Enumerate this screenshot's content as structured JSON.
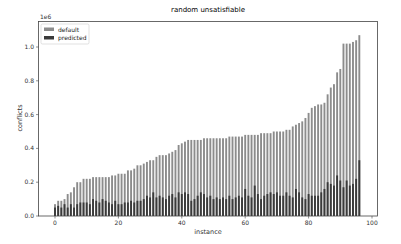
{
  "chart_data": {
    "type": "bar",
    "title": "random unsatisfiable",
    "xlabel": "instance",
    "ylabel": "conflicts",
    "y_scale_label": "1e6",
    "xlim": [
      -5,
      102
    ],
    "ylim": [
      0,
      1.1
    ],
    "xticks": [
      0,
      20,
      40,
      60,
      80,
      100
    ],
    "yticks": [
      0.0,
      0.2,
      0.4,
      0.6,
      0.8,
      1.0
    ],
    "ytick_labels": [
      "0.0",
      "0.2",
      "0.4",
      "0.6",
      "0.8",
      "1.0"
    ],
    "grid": false,
    "legend_position": "upper left",
    "colors": {
      "default": "#8c8c8c",
      "predicted": "#3a3a3a"
    },
    "x": [
      0,
      1,
      2,
      3,
      4,
      5,
      6,
      7,
      8,
      9,
      10,
      11,
      12,
      13,
      14,
      15,
      16,
      17,
      18,
      19,
      20,
      21,
      22,
      23,
      24,
      25,
      26,
      27,
      28,
      29,
      30,
      31,
      32,
      33,
      34,
      35,
      36,
      37,
      38,
      39,
      40,
      41,
      42,
      43,
      44,
      45,
      46,
      47,
      48,
      49,
      50,
      51,
      52,
      53,
      54,
      55,
      56,
      57,
      58,
      59,
      60,
      61,
      62,
      63,
      64,
      65,
      66,
      67,
      68,
      69,
      70,
      71,
      72,
      73,
      74,
      75,
      76,
      77,
      78,
      79,
      80,
      81,
      82,
      83,
      84,
      85,
      86,
      87,
      88,
      89,
      90,
      91,
      92,
      93,
      94,
      95,
      96
    ],
    "series": [
      {
        "name": "default",
        "values": [
          0.07,
          0.09,
          0.09,
          0.1,
          0.13,
          0.14,
          0.17,
          0.2,
          0.2,
          0.22,
          0.22,
          0.22,
          0.23,
          0.23,
          0.23,
          0.23,
          0.23,
          0.23,
          0.24,
          0.24,
          0.25,
          0.25,
          0.25,
          0.27,
          0.27,
          0.28,
          0.3,
          0.3,
          0.31,
          0.32,
          0.33,
          0.33,
          0.35,
          0.36,
          0.36,
          0.36,
          0.37,
          0.38,
          0.39,
          0.42,
          0.43,
          0.44,
          0.45,
          0.45,
          0.45,
          0.45,
          0.45,
          0.46,
          0.46,
          0.46,
          0.46,
          0.46,
          0.46,
          0.46,
          0.46,
          0.47,
          0.47,
          0.47,
          0.47,
          0.47,
          0.48,
          0.48,
          0.48,
          0.48,
          0.48,
          0.49,
          0.49,
          0.49,
          0.49,
          0.5,
          0.5,
          0.5,
          0.5,
          0.51,
          0.51,
          0.53,
          0.54,
          0.55,
          0.56,
          0.58,
          0.61,
          0.64,
          0.65,
          0.66,
          0.66,
          0.67,
          0.72,
          0.76,
          0.78,
          0.85,
          0.87,
          1.02,
          1.02,
          1.02,
          1.03,
          1.04,
          1.07
        ]
      },
      {
        "name": "predicted",
        "values": [
          0.05,
          0.06,
          0.05,
          0.07,
          0.05,
          0.07,
          0.05,
          0.07,
          0.08,
          0.08,
          0.08,
          0.07,
          0.1,
          0.09,
          0.08,
          0.1,
          0.09,
          0.08,
          0.07,
          0.09,
          0.07,
          0.07,
          0.08,
          0.08,
          0.09,
          0.08,
          0.09,
          0.09,
          0.1,
          0.12,
          0.11,
          0.14,
          0.11,
          0.12,
          0.11,
          0.1,
          0.12,
          0.13,
          0.11,
          0.14,
          0.13,
          0.14,
          0.13,
          0.09,
          0.1,
          0.12,
          0.14,
          0.13,
          0.11,
          0.12,
          0.1,
          0.11,
          0.1,
          0.11,
          0.1,
          0.12,
          0.1,
          0.11,
          0.12,
          0.11,
          0.16,
          0.12,
          0.11,
          0.18,
          0.13,
          0.1,
          0.12,
          0.13,
          0.14,
          0.13,
          0.14,
          0.12,
          0.12,
          0.14,
          0.12,
          0.11,
          0.16,
          0.14,
          0.11,
          0.1,
          0.13,
          0.12,
          0.12,
          0.12,
          0.14,
          0.16,
          0.2,
          0.19,
          0.18,
          0.24,
          0.21,
          0.17,
          0.21,
          0.18,
          0.19,
          0.22,
          0.33
        ]
      }
    ]
  }
}
